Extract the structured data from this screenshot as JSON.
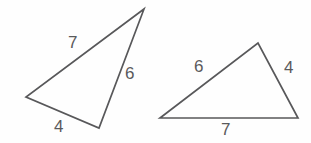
{
  "figure": {
    "background_color": "#fefefe",
    "stroke_color": "#58585a",
    "label_color": "#5a5a5c",
    "width": 311,
    "height": 143
  },
  "shapes": [
    {
      "id": "triangle-left",
      "name": "left-triangle",
      "orientation": "tall-narrow, apex upper-right",
      "vertices": [
        {
          "name": "apex",
          "x": 144,
          "y": 9
        },
        {
          "name": "left",
          "x": 26,
          "y": 97
        },
        {
          "name": "bottom",
          "x": 99,
          "y": 128
        }
      ],
      "points_attr": "144,9 26,97 99,128 144,9",
      "sides": [
        {
          "name": "side-7",
          "value": "7",
          "between": [
            "apex",
            "left"
          ],
          "label_x": 68,
          "label_y": 34
        },
        {
          "name": "side-6",
          "value": "6",
          "between": [
            "apex",
            "bottom"
          ],
          "label_x": 125,
          "label_y": 65
        },
        {
          "name": "side-4",
          "value": "4",
          "between": [
            "left",
            "bottom"
          ],
          "label_x": 54,
          "label_y": 118
        }
      ]
    },
    {
      "id": "triangle-right",
      "name": "right-triangle",
      "orientation": "wide-flat, apex top-center-right",
      "vertices": [
        {
          "name": "left",
          "x": 160,
          "y": 118
        },
        {
          "name": "apex",
          "x": 258,
          "y": 43
        },
        {
          "name": "right",
          "x": 298,
          "y": 118
        }
      ],
      "points_attr": "160,118 258,43 298,118 160,118",
      "sides": [
        {
          "name": "side-6",
          "value": "6",
          "between": [
            "left",
            "apex"
          ],
          "label_x": 194,
          "label_y": 58
        },
        {
          "name": "side-4",
          "value": "4",
          "between": [
            "apex",
            "right"
          ],
          "label_x": 284,
          "label_y": 59
        },
        {
          "name": "side-7",
          "value": "7",
          "between": [
            "left",
            "right"
          ],
          "label_x": 221,
          "label_y": 121
        }
      ]
    }
  ],
  "labels": {
    "left_triangle": {
      "side_7": "7",
      "side_6": "6",
      "side_4": "4"
    },
    "right_triangle": {
      "side_6": "6",
      "side_4": "4",
      "side_7": "7"
    }
  }
}
